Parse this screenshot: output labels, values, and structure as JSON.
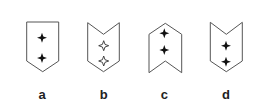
{
  "figure": {
    "options": [
      {
        "label": "a",
        "shape": "shield-pointed-bottom",
        "top_edge": "flat",
        "bottom_edge": "point-down",
        "star_style": "filled",
        "star_count": 2
      },
      {
        "label": "b",
        "shape": "chevron-notched-top",
        "top_edge": "v-notch",
        "bottom_edge": "point-down",
        "star_style": "outline",
        "star_count": 2
      },
      {
        "label": "c",
        "shape": "chevron-pointed-top",
        "top_edge": "point-up",
        "bottom_edge": "v-notch",
        "star_style": "filled",
        "star_count": 2
      },
      {
        "label": "d",
        "shape": "chevron-notched-top",
        "top_edge": "v-notch",
        "bottom_edge": "point-down",
        "star_style": "filled",
        "star_count": 2
      }
    ],
    "colors": {
      "outline": "#555555",
      "star": "#111111",
      "label": "#222222",
      "background": "#ffffff"
    }
  }
}
